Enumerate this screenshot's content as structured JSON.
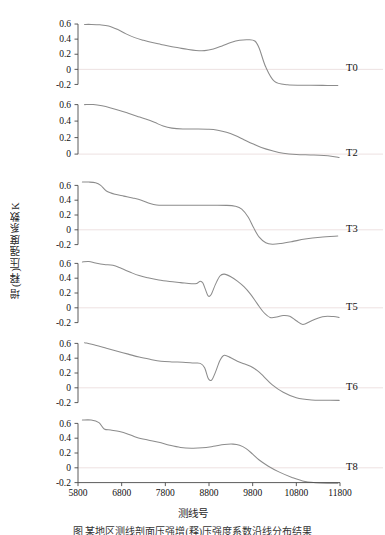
{
  "figure": {
    "y_axis_title": "增(释)压强度系数K",
    "x_axis_title": "测线号",
    "caption": "图    某地区测线剖面压强增(释)压强度系数沿线分布结果"
  },
  "chart_data": {
    "type": "line",
    "title": "",
    "xlabel": "测线号",
    "ylabel": "增(释)压强度系数K",
    "xlim": [
      5800,
      11800
    ],
    "xticks": [
      5800,
      6800,
      7800,
      8800,
      9800,
      10800,
      11800
    ],
    "grid": false,
    "legend": "none",
    "zero_reference_line": true,
    "line_color": "#8c8c8c",
    "axis_color": "#4a4a4a",
    "zero_line_color": "#e8d9d9",
    "panel_layout": "stacked-vertical-shared-x",
    "panels": [
      {
        "label": "T0",
        "ylim": [
          -0.3,
          0.68
        ],
        "yticks": [
          0.6,
          0.4,
          0.2,
          0,
          -0.2
        ],
        "ytick_labels": [
          "0.6",
          "0.4",
          "0.2",
          "0",
          "-0.2"
        ],
        "x": [
          5950,
          6100,
          6300,
          6500,
          6700,
          6900,
          7100,
          7300,
          7500,
          7700,
          7900,
          8100,
          8300,
          8500,
          8700,
          8900,
          9100,
          9300,
          9500,
          9700,
          9850,
          9950,
          10100,
          10300,
          10600,
          11000,
          11400,
          11750
        ],
        "y": [
          0.595,
          0.595,
          0.59,
          0.575,
          0.53,
          0.47,
          0.42,
          0.385,
          0.355,
          0.33,
          0.305,
          0.285,
          0.265,
          0.25,
          0.248,
          0.27,
          0.31,
          0.355,
          0.385,
          0.392,
          0.375,
          0.28,
          0.03,
          -0.16,
          -0.205,
          -0.21,
          -0.212,
          -0.215
        ]
      },
      {
        "label": "T2",
        "ylim": [
          -0.12,
          0.68
        ],
        "yticks": [
          0.6,
          0.4,
          0.2,
          0
        ],
        "ytick_labels": [
          "0.6",
          "0.4",
          "0.2",
          "0"
        ],
        "x": [
          5950,
          6150,
          6350,
          6550,
          6750,
          6950,
          7150,
          7350,
          7550,
          7750,
          7950,
          8200,
          8500,
          8800,
          9000,
          9200,
          9400,
          9600,
          9800,
          10000,
          10250,
          10500,
          10800,
          11200,
          11600,
          11780
        ],
        "y": [
          0.6,
          0.6,
          0.585,
          0.56,
          0.53,
          0.495,
          0.46,
          0.425,
          0.385,
          0.34,
          0.315,
          0.305,
          0.305,
          0.302,
          0.29,
          0.265,
          0.225,
          0.175,
          0.125,
          0.08,
          0.04,
          0.01,
          -0.005,
          -0.012,
          -0.025,
          -0.04
        ]
      },
      {
        "label": "T3",
        "ylim": [
          -0.3,
          0.7
        ],
        "yticks": [
          0.6,
          0.4,
          0.2,
          0,
          -0.2
        ],
        "ytick_labels": [
          "0.6",
          "0.4",
          "0.2",
          "0",
          "-0.2"
        ],
        "x": [
          5900,
          6050,
          6200,
          6320,
          6450,
          6650,
          6850,
          7050,
          7250,
          7450,
          7600,
          7800,
          8100,
          8500,
          8900,
          9200,
          9400,
          9550,
          9700,
          9820,
          9950,
          10100,
          10250,
          10450,
          10700,
          11000,
          11350,
          11750
        ],
        "y": [
          0.645,
          0.645,
          0.635,
          0.6,
          0.525,
          0.48,
          0.455,
          0.43,
          0.4,
          0.355,
          0.335,
          0.332,
          0.332,
          0.332,
          0.332,
          0.33,
          0.318,
          0.28,
          0.17,
          0.03,
          -0.1,
          -0.175,
          -0.195,
          -0.185,
          -0.16,
          -0.125,
          -0.1,
          -0.085
        ]
      },
      {
        "label": "T5",
        "ylim": [
          -0.3,
          0.7
        ],
        "yticks": [
          0.6,
          0.4,
          0.2,
          0,
          -0.2
        ],
        "ytick_labels": [
          "0.6",
          "0.4",
          "0.2",
          "0",
          "-0.2"
        ],
        "x": [
          5900,
          6050,
          6200,
          6400,
          6600,
          6800,
          7000,
          7200,
          7400,
          7650,
          7900,
          8150,
          8400,
          8520,
          8600,
          8660,
          8720,
          8780,
          8850,
          8950,
          9050,
          9150,
          9300,
          9450,
          9600,
          9750,
          9900,
          10050,
          10200,
          10350,
          10500,
          10650,
          10800,
          10950,
          11150,
          11400,
          11650,
          11780
        ],
        "y": [
          0.62,
          0.625,
          0.605,
          0.585,
          0.575,
          0.53,
          0.48,
          0.435,
          0.405,
          0.375,
          0.355,
          0.34,
          0.325,
          0.33,
          0.36,
          0.335,
          0.245,
          0.16,
          0.18,
          0.32,
          0.43,
          0.455,
          0.42,
          0.36,
          0.285,
          0.185,
          0.06,
          -0.06,
          -0.13,
          -0.125,
          -0.105,
          -0.115,
          -0.175,
          -0.225,
          -0.175,
          -0.12,
          -0.118,
          -0.13
        ]
      },
      {
        "label": "T6",
        "ylim": [
          -0.3,
          0.7
        ],
        "yticks": [
          0.6,
          0.4,
          0.2,
          0,
          -0.2
        ],
        "ytick_labels": [
          "0.6",
          "0.4",
          "0.2",
          "0",
          "-0.2"
        ],
        "x": [
          5950,
          6200,
          6450,
          6700,
          6950,
          7200,
          7450,
          7700,
          7950,
          8200,
          8450,
          8600,
          8700,
          8780,
          8860,
          8950,
          9050,
          9150,
          9300,
          9450,
          9600,
          9750,
          9900,
          10050,
          10250,
          10500,
          10800,
          11150,
          11500,
          11780
        ],
        "y": [
          0.61,
          0.575,
          0.535,
          0.495,
          0.455,
          0.415,
          0.385,
          0.36,
          0.35,
          0.345,
          0.335,
          0.33,
          0.27,
          0.13,
          0.105,
          0.215,
          0.37,
          0.44,
          0.405,
          0.36,
          0.325,
          0.29,
          0.235,
          0.155,
          0.04,
          -0.06,
          -0.135,
          -0.165,
          -0.168,
          -0.17
        ]
      },
      {
        "label": "T8",
        "ylim": [
          -0.3,
          0.7
        ],
        "yticks": [
          0.6,
          0.4,
          0.2,
          0,
          -0.2
        ],
        "ytick_labels": [
          "0.6",
          "0.4",
          "0.2",
          "0",
          "-0.2"
        ],
        "x": [
          5900,
          6100,
          6280,
          6400,
          6550,
          6750,
          6950,
          7150,
          7400,
          7650,
          7900,
          8150,
          8400,
          8650,
          8900,
          9150,
          9350,
          9500,
          9650,
          9800,
          9950,
          10150,
          10400,
          10700,
          11000,
          11350,
          11750
        ],
        "y": [
          0.645,
          0.645,
          0.61,
          0.525,
          0.51,
          0.49,
          0.455,
          0.41,
          0.375,
          0.345,
          0.305,
          0.275,
          0.265,
          0.27,
          0.29,
          0.315,
          0.32,
          0.305,
          0.26,
          0.185,
          0.105,
          0.025,
          -0.055,
          -0.13,
          -0.185,
          -0.205,
          -0.207
        ]
      }
    ]
  }
}
